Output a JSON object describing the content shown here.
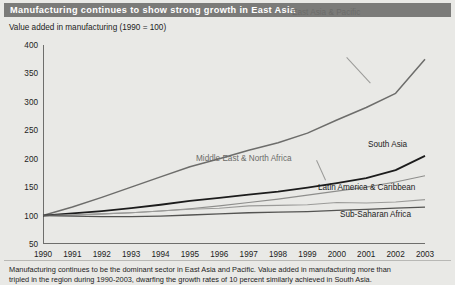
{
  "header": {
    "title": "Manufacturing continues to show strong growth in East Asia"
  },
  "subtitle": "Value added in manufacturing (1990 = 100)",
  "footnote": {
    "line1": "Manufacturing continues to be the dominant sector in East Asia and Pacific. Value added in manufacturing more than",
    "line2": "tripled in the region during 1990-2003, dwarfing the growth rates of 10 percent similarly achieved in South Asia."
  },
  "colors": {
    "header_bar": "#7b7b79",
    "header_text": "#ffffff",
    "background": "#e9e9e6",
    "axis": "#6e6e6c",
    "east_asia": "#6d6d6b",
    "south_asia": "#1c1c1c",
    "middle_east": "#8e8e8c",
    "latin_america": "#9b9b99",
    "sub_saharan": "#545452"
  },
  "chart_data": {
    "type": "line",
    "title": "Manufacturing continues to show strong growth in East Asia",
    "subtitle": "Value added in manufacturing (1990 = 100)",
    "xlabel": "",
    "ylabel": "Value added in manufacturing (1990 = 100)",
    "xlim": [
      1990,
      2003
    ],
    "ylim": [
      50,
      400
    ],
    "ytick_step": 50,
    "grid": false,
    "legend": "inline-labels",
    "x": [
      1990,
      1991,
      1992,
      1993,
      1994,
      1995,
      1996,
      1997,
      1998,
      1999,
      2000,
      2001,
      2002,
      2003
    ],
    "categories": [
      "1990",
      "1991",
      "1992",
      "1993",
      "1994",
      "1995",
      "1996",
      "1997",
      "1998",
      "1999",
      "2000",
      "2001",
      "2002",
      "2003"
    ],
    "yticks": [
      50,
      100,
      150,
      200,
      250,
      300,
      350,
      400
    ],
    "series": [
      {
        "name": "East Asia & Pacific",
        "color": "#6d6d6b",
        "values": [
          100,
          115,
          132,
          150,
          168,
          186,
          200,
          215,
          228,
          245,
          268,
          290,
          315,
          375
        ]
      },
      {
        "name": "South Asia",
        "color": "#1c1c1c",
        "values": [
          100,
          104,
          108,
          113,
          119,
          126,
          131,
          137,
          142,
          149,
          157,
          166,
          180,
          205
        ]
      },
      {
        "name": "Middle East & North Africa",
        "color": "#8e8e8c",
        "values": [
          100,
          101,
          103,
          105,
          108,
          112,
          117,
          123,
          129,
          136,
          143,
          150,
          159,
          170
        ]
      },
      {
        "name": "Latin America & Caribbean",
        "color": "#9b9b99",
        "values": [
          100,
          101,
          103,
          105,
          108,
          111,
          113,
          117,
          118,
          119,
          123,
          122,
          124,
          128
        ]
      },
      {
        "name": "Sub-Saharan Africa",
        "color": "#545452",
        "values": [
          100,
          99,
          98,
          98,
          99,
          101,
          103,
          105,
          106,
          107,
          109,
          111,
          113,
          115
        ]
      }
    ]
  }
}
